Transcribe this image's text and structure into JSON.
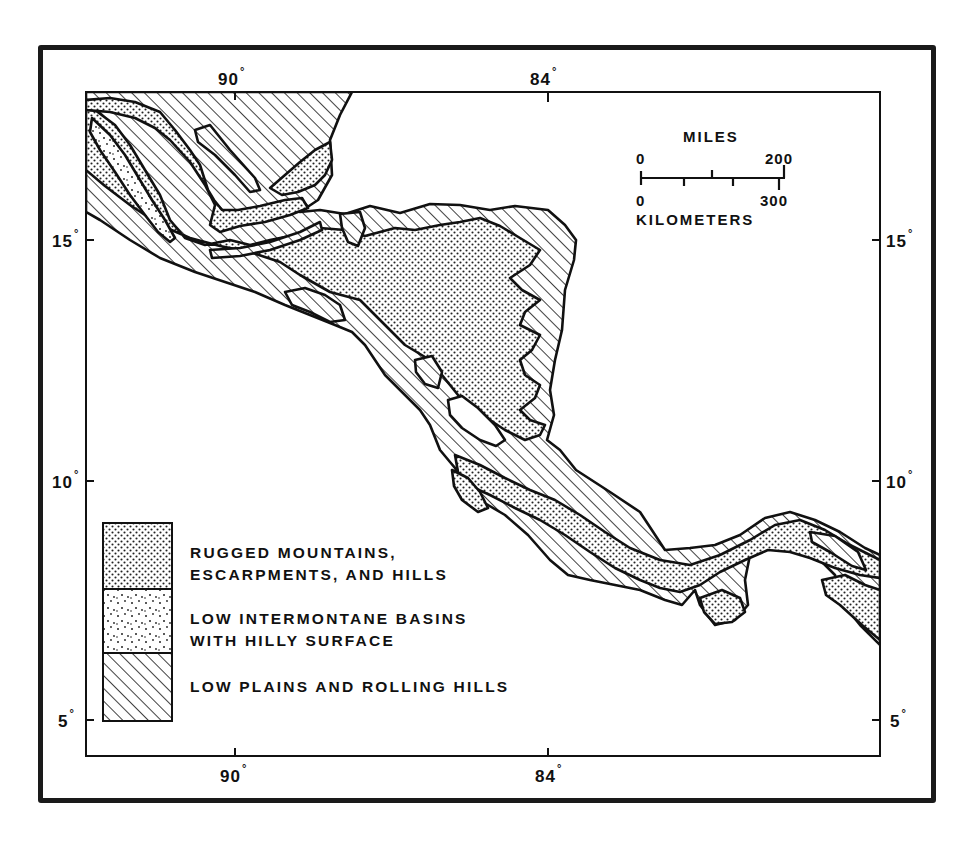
{
  "figure": {
    "type": "physiographic-map",
    "region_depicted": "Central America",
    "colors": {
      "ink": "#111111",
      "background": "#ffffff"
    }
  },
  "axes": {
    "longitude_top": [
      {
        "label": "90",
        "unit": "°"
      },
      {
        "label": "84",
        "unit": "°"
      }
    ],
    "longitude_bottom": [
      {
        "label": "90",
        "unit": "°"
      },
      {
        "label": "84",
        "unit": "°"
      }
    ],
    "latitude_left": [
      {
        "label": "15",
        "unit": "°"
      },
      {
        "label": "10",
        "unit": "°"
      },
      {
        "label": "5",
        "unit": "°"
      }
    ],
    "latitude_right": [
      {
        "label": "15",
        "unit": "°"
      },
      {
        "label": "10",
        "unit": "°"
      },
      {
        "label": "5",
        "unit": "°"
      }
    ]
  },
  "scale_bar": {
    "top_title": "MILES",
    "miles_start": "0",
    "miles_end": "200",
    "km_start": "0",
    "km_end": "300",
    "bottom_title": "KILOMETERS"
  },
  "legend": {
    "items": [
      {
        "pattern": "dense-dots",
        "line1": "RUGGED MOUNTAINS,",
        "line2": "ESCARPMENTS, AND HILLS"
      },
      {
        "pattern": "sparse-dots",
        "line1": "LOW INTERMONTANE BASINS",
        "line2": "WITH HILLY SURFACE"
      },
      {
        "pattern": "diagonal-hatch",
        "line1": "LOW PLAINS AND ROLLING HILLS",
        "line2": ""
      }
    ]
  }
}
